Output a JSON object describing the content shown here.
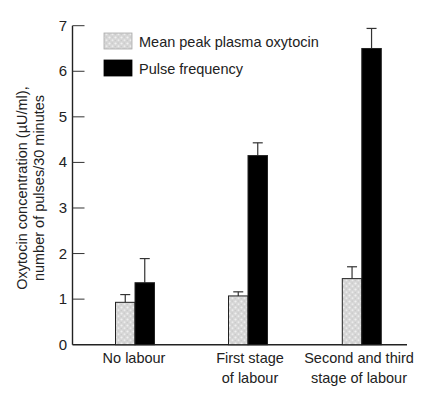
{
  "chart_data": {
    "type": "bar",
    "title": "",
    "xlabel": "",
    "ylabel": [
      "Oxytocin concentration (µU/ml),",
      "number of pulses/30 minutes"
    ],
    "ylim": [
      0,
      7
    ],
    "yticks": [
      0,
      1,
      2,
      3,
      4,
      5,
      6,
      7
    ],
    "grid": false,
    "legend_position": "upper-left inside",
    "categories": [
      [
        "No labour"
      ],
      [
        "First stage",
        "of labour"
      ],
      [
        "Second and third",
        "stage of labour"
      ]
    ],
    "series": [
      {
        "name": "Mean peak plasma oxytocin",
        "pattern": "light-gray-speckle",
        "color": "#d9d9d9",
        "values": [
          0.93,
          1.07,
          1.45
        ],
        "error_upper": [
          1.1,
          1.16,
          1.71
        ]
      },
      {
        "name": "Pulse frequency",
        "pattern": "solid",
        "color": "#000000",
        "values": [
          1.36,
          4.15,
          6.5
        ],
        "error_upper": [
          1.89,
          4.43,
          6.94
        ]
      }
    ]
  },
  "legend": {
    "items": [
      {
        "label": "Mean peak plasma oxytocin"
      },
      {
        "label": "Pulse frequency"
      }
    ]
  }
}
